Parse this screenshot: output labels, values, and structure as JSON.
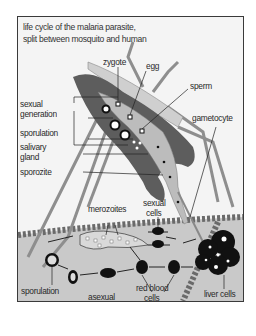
{
  "title": {
    "line1": "life cycle of the malaria parasite,",
    "line2": "split between mosquito and human"
  },
  "mosquito_labels": {
    "zygote": "zygote",
    "egg": "egg",
    "sperm": "sperm",
    "sexual_generation_1": "sexual",
    "sexual_generation_2": "generation",
    "sporulation": "sporulation",
    "gametocyte": "gametocyte",
    "salivary_gland_1": "salivary",
    "salivary_gland_2": "gland",
    "sporozite": "sporozite"
  },
  "human_labels": {
    "merozoites": "merozoites",
    "sexual_cells_1": "sexual",
    "sexual_cells_2": "cells",
    "sporulation": "sporulation",
    "asexual_generation_1": "asexual",
    "asexual_generation_2": "generation",
    "red_blood_cells_1": "red blood",
    "red_blood_cells_2": "cells",
    "liver_cells": "liver cells"
  },
  "colors": {
    "frame_bg": "#f4f4f4",
    "blood_bg": "#c8c8c8",
    "mosquito_dark": "#5a5a5a",
    "mosquito_light": "#b5b5b5",
    "cell_black": "#111111"
  }
}
